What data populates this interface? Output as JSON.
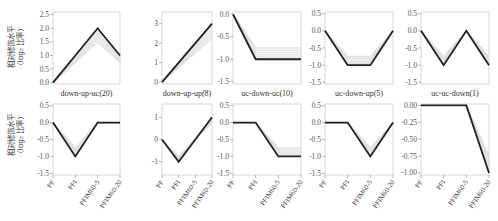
{
  "chart_data": {
    "type": "line",
    "layout": "2 rows x 5 columns small multiples",
    "ylabel": "相对修饰水平 (log2 比率)",
    "x": [
      "PF",
      "PFI",
      "PFIM60-5",
      "PFIM60-20"
    ],
    "grid": false,
    "panels": [
      {
        "row": 0,
        "col": 0,
        "title": "down-up-uc(20)",
        "yticks": [
          "0.0",
          "0.5",
          "1.0",
          "1.5",
          "2.0",
          "2.5"
        ],
        "ylim": [
          0,
          2.5
        ],
        "values": [
          0,
          1,
          2,
          1
        ],
        "note": "row-1 values represent centroid; true y: 0,~1,2,1"
      },
      {
        "row": 0,
        "col": 1,
        "title": "down-up-up(8)",
        "yticks": [
          "0",
          "1",
          "2",
          "3"
        ],
        "ylim": [
          -0.1,
          3.6
        ],
        "values": [
          0,
          1,
          2,
          3
        ]
      },
      {
        "row": 0,
        "col": 2,
        "title": "uc-down-uc(10)",
        "yticks": [
          "-1.5",
          "-1.0",
          "-0.5",
          "0.0"
        ],
        "ylim": [
          -1.5,
          0.05
        ],
        "values": [
          0,
          -0.5,
          -1.0,
          -1.0
        ]
      },
      {
        "row": 0,
        "col": 3,
        "title": "uc-down-up(5)",
        "yticks": [
          "-1.5",
          "-1.0",
          "-0.5",
          "0.0",
          "0.5"
        ],
        "ylim": [
          -1.5,
          0.5
        ],
        "values": [
          0,
          -0.5,
          -1.0,
          0
        ]
      },
      {
        "row": 0,
        "col": 4,
        "title": "uc-uc-down(1)",
        "yticks": [
          "-1.5",
          "-1.0",
          "-0.5",
          "0.0",
          "0.5"
        ],
        "ylim": [
          -1.5,
          0.5
        ],
        "values": [
          0,
          -1.0,
          0,
          -1.0
        ]
      },
      {
        "row": 1,
        "col": 0,
        "title": "",
        "yticks": [
          "-1.5",
          "-1.0",
          "-0.5",
          "0.0",
          "0.5"
        ],
        "ylim": [
          -1.5,
          0.5
        ],
        "values": [
          0,
          -1.0,
          0,
          0
        ]
      },
      {
        "row": 1,
        "col": 1,
        "title": "",
        "yticks": [
          "-1",
          "0",
          "1"
        ],
        "ylim": [
          -1.5,
          1.5
        ],
        "values": [
          0,
          -1,
          0,
          1
        ]
      },
      {
        "row": 1,
        "col": 2,
        "title": "",
        "yticks": [
          "-1.5",
          "-1.0",
          "-0.5",
          "0.0",
          "0.5"
        ],
        "ylim": [
          -1.5,
          0.5
        ],
        "values": [
          0,
          0,
          -1.0,
          -1.0
        ]
      },
      {
        "row": 1,
        "col": 3,
        "title": "",
        "yticks": [
          "-1.5",
          "-1.0",
          "-0.5",
          "0.0",
          "0.5"
        ],
        "ylim": [
          -1.5,
          0.5
        ],
        "values": [
          0,
          0,
          -1.0,
          0
        ]
      },
      {
        "row": 1,
        "col": 4,
        "title": "",
        "yticks": [
          "-1.00",
          "-0.75",
          "-0.50",
          "-0.25",
          "0.00"
        ],
        "ylim": [
          -1.0,
          0.02
        ],
        "values": [
          0,
          0,
          0,
          -1.0
        ]
      }
    ]
  },
  "titles": [
    "down-up-uc(20)",
    "down-up-up(8)",
    "uc-down-uc(10)",
    "uc-down-up(5)",
    "uc-uc-down(1)"
  ],
  "ylabel_line1": "相对修饰水平",
  "ylabel_line2": "(log₂ 比率)",
  "colors": {
    "main_line": "#222222",
    "member_lines": "#d8d8d8",
    "frame": "#cccccc",
    "tick_text": "#555555"
  }
}
